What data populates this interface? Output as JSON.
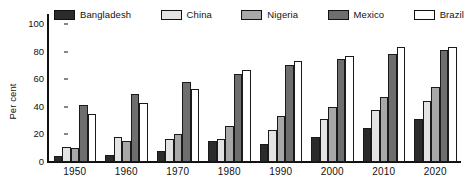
{
  "chart_data": {
    "type": "bar",
    "title": "",
    "xlabel": "",
    "ylabel": "Per cent",
    "ylim": [
      0,
      100
    ],
    "yticks": [
      0,
      20,
      40,
      60,
      80,
      100
    ],
    "grid": false,
    "legend_position": "top",
    "categories": [
      "1950",
      "1960",
      "1970",
      "1980",
      "1990",
      "2000",
      "2010",
      "2020"
    ],
    "series": [
      {
        "name": "Bangladesh",
        "color": "#2b2b2b",
        "values": [
          4,
          5,
          8,
          15,
          13,
          18,
          25,
          31
        ]
      },
      {
        "name": "China",
        "color": "#e3e3e3",
        "values": [
          11,
          18,
          17,
          17,
          23,
          31,
          38,
          44
        ]
      },
      {
        "name": "Nigeria",
        "color": "#a8a8a8",
        "values": [
          10,
          15,
          20,
          26,
          33,
          40,
          47,
          54
        ]
      },
      {
        "name": "Mexico",
        "color": "#6e6e6e",
        "values": [
          41,
          49,
          58,
          64,
          70,
          75,
          78,
          81
        ]
      },
      {
        "name": "Brazil",
        "color": "#ffffff",
        "values": [
          35,
          43,
          53,
          67,
          73,
          77,
          83,
          83
        ]
      }
    ]
  },
  "legend": {
    "items": [
      {
        "label": "Bangladesh",
        "color": "#2b2b2b"
      },
      {
        "label": "China",
        "color": "#e3e3e3"
      },
      {
        "label": "Nigeria",
        "color": "#a8a8a8"
      },
      {
        "label": "Mexico",
        "color": "#6e6e6e"
      },
      {
        "label": "Brazil",
        "color": "#ffffff"
      }
    ]
  }
}
